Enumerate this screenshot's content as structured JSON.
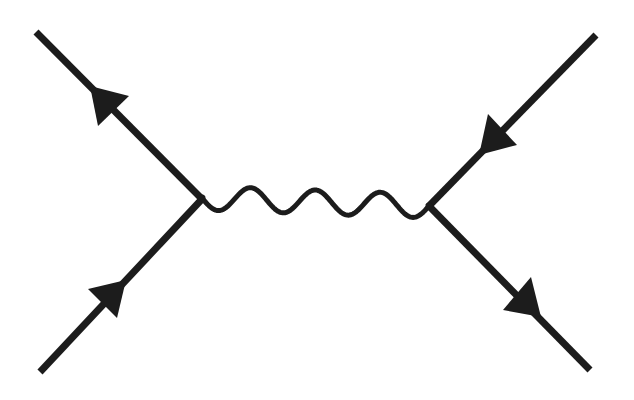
{
  "diagram": {
    "type": "feynman-diagram",
    "ink_color": "#1c1c1c",
    "background_color": "#ffffff",
    "vertices": [
      {
        "id": "v1",
        "name": "left-vertex"
      },
      {
        "id": "v2",
        "name": "right-vertex"
      }
    ],
    "propagators": [
      {
        "id": "photon",
        "kind": "wavy",
        "from": "v1",
        "to": "v2",
        "half_waves": 7
      }
    ],
    "external_lines": [
      {
        "id": "top-left",
        "kind": "fermion",
        "attached_to": "v1",
        "arrow": "outgoing"
      },
      {
        "id": "bottom-left",
        "kind": "fermion",
        "attached_to": "v1",
        "arrow": "incoming"
      },
      {
        "id": "top-right",
        "kind": "fermion",
        "attached_to": "v2",
        "arrow": "incoming"
      },
      {
        "id": "bottom-right",
        "kind": "fermion",
        "attached_to": "v2",
        "arrow": "outgoing"
      }
    ],
    "labels": []
  }
}
